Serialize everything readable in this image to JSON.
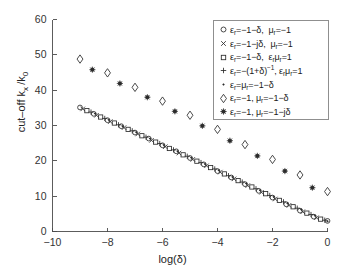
{
  "chart_data": {
    "type": "scatter",
    "title": "",
    "xlabel": "log(δ)",
    "ylabel": "cut-off k_x/k_0",
    "xlim": [
      -10,
      0
    ],
    "ylim": [
      0,
      60
    ],
    "xticks": [
      -10,
      -8,
      -6,
      -4,
      -2,
      0
    ],
    "yticks": [
      0,
      10,
      20,
      30,
      40,
      50,
      60
    ],
    "xtick_labels": [
      "-10",
      "-8",
      "-6",
      "-4",
      "-2",
      "0"
    ],
    "ytick_labels": [
      "0",
      "10",
      "20",
      "30",
      "40",
      "50",
      "60"
    ],
    "grid": false,
    "legend_position": "upper right",
    "series": [
      {
        "name": "eps_r = -1-delta, mu_r = -1",
        "marker": "circle",
        "legend_label_html": "ε<sub>r</sub>=−1−δ,&nbsp; μ<sub>r</sub>=−1",
        "x": [
          -9.0,
          -8.5,
          -8.0,
          -7.5,
          -7.0,
          -6.5,
          -6.0,
          -5.5,
          -5.0,
          -4.5,
          -4.0,
          -3.5,
          -3.0,
          -2.5,
          -2.0,
          -1.5,
          -1.0,
          -0.5,
          0.0
        ],
        "y": [
          35.1,
          33.3,
          31.5,
          29.8,
          28.0,
          26.3,
          24.4,
          22.7,
          20.8,
          19.0,
          17.1,
          15.3,
          13.4,
          11.5,
          9.6,
          7.7,
          5.9,
          4.2,
          3.0
        ]
      },
      {
        "name": "eps_r = -1-j delta, mu_r = -1",
        "marker": "cross",
        "legend_label_html": "ε<sub>r</sub>=−1−jδ,&nbsp; μ<sub>r</sub>=−1",
        "x": [
          -8.9,
          -8.4,
          -7.9,
          -7.4,
          -6.9,
          -6.4,
          -5.9,
          -5.4,
          -4.9,
          -4.4,
          -3.9,
          -3.4,
          -2.9,
          -2.4,
          -1.9,
          -1.4,
          -0.9,
          -0.4
        ],
        "y": [
          34.7,
          32.9,
          31.1,
          29.4,
          27.6,
          25.8,
          24.0,
          22.2,
          20.4,
          18.6,
          16.8,
          14.9,
          13.0,
          11.1,
          9.2,
          7.4,
          5.6,
          3.9
        ]
      },
      {
        "name": "eps_r = -1-delta, eps_r mu_r = 1",
        "marker": "square",
        "legend_label_html": "ε<sub>r</sub>=−1−δ,&nbsp; ε<sub>r</sub>μ<sub>r</sub>=1",
        "x": [
          -8.75,
          -8.25,
          -7.75,
          -7.25,
          -6.75,
          -6.25,
          -5.75,
          -5.25,
          -4.75,
          -4.25,
          -3.75,
          -3.25,
          -2.75,
          -2.25,
          -1.75,
          -1.25,
          -0.75,
          -0.25
        ],
        "y": [
          34.2,
          32.4,
          30.7,
          28.9,
          27.1,
          25.3,
          23.5,
          21.7,
          19.9,
          18.1,
          16.3,
          14.4,
          12.6,
          10.7,
          8.8,
          7.0,
          5.2,
          3.5
        ]
      },
      {
        "name": "eps_r = -(1+delta)^-1, eps_r mu_r = 1",
        "marker": "plus",
        "legend_label_html": "ε<sub>r</sub>=−(1+δ)<sup>−1</sup>,&nbsp;ε<sub>r</sub>μ<sub>r</sub>=1",
        "x": [
          -8.6,
          -8.1,
          -7.6,
          -7.1,
          -6.6,
          -6.1,
          -5.6,
          -5.1,
          -4.6,
          -4.1,
          -3.6,
          -3.1,
          -2.6,
          -2.1,
          -1.6,
          -1.1,
          -0.6,
          -0.1
        ],
        "y": [
          33.8,
          32.0,
          30.2,
          28.5,
          26.7,
          24.9,
          23.1,
          21.3,
          19.5,
          17.7,
          15.8,
          14.0,
          12.1,
          10.2,
          8.4,
          6.6,
          4.8,
          3.2
        ]
      },
      {
        "name": "eps_r = mu_r = -1-delta",
        "marker": "dot",
        "legend_label_html": "ε<sub>r</sub>=μ<sub>r</sub>=−1−δ",
        "x": [
          -8.45,
          -7.95,
          -7.45,
          -6.95,
          -6.45,
          -5.95,
          -5.45,
          -4.95,
          -4.45,
          -3.95,
          -3.45,
          -2.95,
          -2.45,
          -1.95,
          -1.45,
          -0.95,
          -0.45,
          0.0
        ],
        "y": [
          33.4,
          31.6,
          29.8,
          28.1,
          26.3,
          24.5,
          22.7,
          20.9,
          19.1,
          17.3,
          15.4,
          13.6,
          11.7,
          9.8,
          8.0,
          6.2,
          4.5,
          2.9
        ]
      },
      {
        "name": "eps_r = -1, mu_r = -1-delta",
        "marker": "diamond",
        "legend_label_html": "ε<sub>r</sub>=−1,&nbsp;μ<sub>r</sub>=−1−δ",
        "x": [
          -9.0,
          -8.0,
          -7.0,
          -6.0,
          -5.0,
          -4.0,
          -3.0,
          -2.0,
          -1.0,
          0.0
        ],
        "y": [
          48.8,
          44.9,
          40.8,
          36.9,
          32.9,
          28.9,
          24.6,
          20.4,
          16.0,
          11.3
        ]
      },
      {
        "name": "eps_r = -1, mu_r = -1-j delta",
        "marker": "star",
        "legend_label_html": "ε<sub>r</sub>=−1,&nbsp;μ<sub>r</sub>=−1−jδ",
        "x": [
          -8.55,
          -7.55,
          -6.55,
          -5.55,
          -4.55,
          -3.55,
          -2.55,
          -1.55,
          -0.55
        ],
        "y": [
          45.8,
          41.9,
          38.0,
          34.0,
          29.9,
          25.7,
          21.4,
          17.1,
          12.4
        ]
      }
    ]
  },
  "colors": {
    "marker": "#2b2b2b",
    "axis": "#4a4a4a",
    "legend_border": "#8f8f8f",
    "background": "#ffffff"
  }
}
